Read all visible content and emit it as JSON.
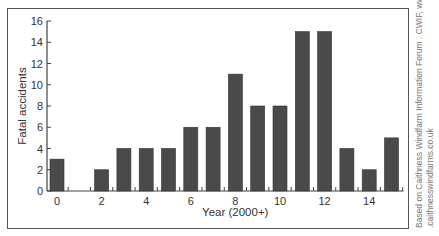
{
  "chart_data": {
    "type": "bar",
    "title": "",
    "xlabel": "Year (2000+)",
    "ylabel": "Fatal accidents",
    "categories": [
      0,
      1,
      2,
      3,
      4,
      5,
      6,
      7,
      8,
      9,
      10,
      11,
      12,
      13,
      14,
      15
    ],
    "values": [
      3,
      0,
      2,
      4,
      4,
      4,
      6,
      6,
      11,
      8,
      8,
      15,
      15,
      4,
      2,
      5
    ],
    "x_tick_labels": [
      "0",
      "2",
      "4",
      "6",
      "8",
      "10",
      "12",
      "14"
    ],
    "y_tick_labels": [
      "0",
      "2",
      "4",
      "6",
      "8",
      "10",
      "12",
      "14",
      "16"
    ],
    "ylim": [
      0,
      16
    ],
    "grid": false,
    "legend": null,
    "bar_color": "#4a4a4a"
  },
  "credit": {
    "line1": "Based on Caithness Windfarm Information Forum . CWIF, www",
    "line2": ".caithnesswindfarms.co.uk"
  }
}
